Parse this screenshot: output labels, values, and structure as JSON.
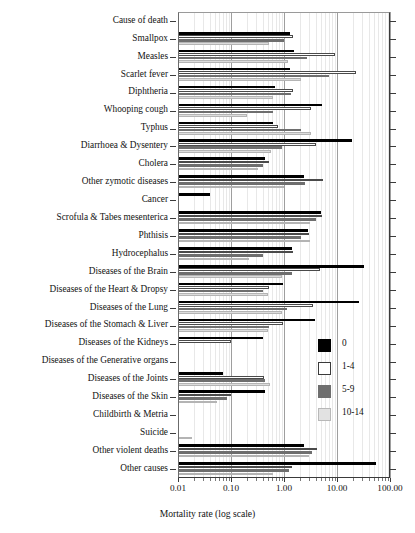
{
  "chart_data": {
    "type": "bar",
    "orientation": "horizontal",
    "title": "",
    "xlabel": "Mortality rate (log scale)",
    "ylabel": "",
    "xscale": "log",
    "xlim": [
      0.01,
      100
    ],
    "xticks": [
      0.01,
      0.1,
      1.0,
      10.0,
      100.0
    ],
    "xticklabels": [
      "0.01",
      "0.10",
      "1.00",
      "10.00",
      "100.00"
    ],
    "grid": true,
    "legend_position": "center-right",
    "legend_title": "",
    "categories": [
      "Cause of death",
      "Smallpox",
      "Measles",
      "Scarlet fever",
      "Diphtheria",
      "Whooping cough",
      "Typhus",
      "Diarrhoea & Dysentery",
      "Cholera",
      "Other zymotic diseases",
      "Cancer",
      "Scrofula & Tabes mesenterica",
      "Phthisis",
      "Hydrocephalus",
      "Diseases of the Brain",
      "Diseases of the Heart & Dropsy",
      "Diseases of the Lung",
      "Diseases of the Stomach & Liver",
      "Diseases of the Kidneys",
      "Diseases of the Generative organs",
      "Diseases of the Joints",
      "Diseases of the Skin",
      "Childbirth & Metria",
      "Suicide",
      "Other violent deaths",
      "Other causes"
    ],
    "series": [
      {
        "name": "0",
        "color": "#000000",
        "values": [
          null,
          1.3,
          1.55,
          1.3,
          0.68,
          5.1,
          0.62,
          19.0,
          0.44,
          2.35,
          0.04,
          5.0,
          2.85,
          1.4,
          33.0,
          0.95,
          26.0,
          3.8,
          0.4,
          null,
          0.07,
          0.44,
          null,
          null,
          2.4,
          55.0
        ]
      },
      {
        "name": "1-4",
        "color": "#ffffff",
        "values": [
          null,
          1.5,
          9.2,
          23.0,
          1.45,
          3.3,
          0.78,
          4.0,
          0.52,
          5.4,
          null,
          5.3,
          2.9,
          1.45,
          4.8,
          0.52,
          3.6,
          0.95,
          0.1,
          null,
          0.42,
          0.1,
          null,
          null,
          4.2,
          1.4
        ]
      },
      {
        "name": "5-9",
        "color": "#6e6e6e",
        "values": [
          null,
          0.98,
          2.7,
          7.0,
          1.35,
          0.62,
          2.1,
          0.9,
          0.4,
          2.5,
          null,
          4.1,
          2.1,
          0.4,
          1.4,
          0.4,
          1.15,
          0.52,
          null,
          null,
          0.44,
          0.085,
          null,
          null,
          3.4,
          1.25
        ]
      },
      {
        "name": "10-14",
        "color": "#dcdcdc",
        "values": [
          null,
          0.52,
          1.2,
          2.1,
          0.62,
          0.2,
          3.3,
          0.58,
          0.33,
          1.0,
          null,
          3.05,
          3.1,
          0.22,
          0.9,
          0.5,
          0.9,
          0.5,
          null,
          null,
          0.55,
          0.055,
          null,
          0.018,
          2.9,
          0.62
        ]
      }
    ]
  },
  "legend": {
    "items": [
      {
        "label": "0",
        "swatch": "black-filled-swatch"
      },
      {
        "label": "1-4",
        "swatch": "white-outlined-swatch"
      },
      {
        "label": "5-9",
        "swatch": "dark-gray-swatch"
      },
      {
        "label": "10-14",
        "swatch": "light-gray-swatch"
      }
    ]
  }
}
